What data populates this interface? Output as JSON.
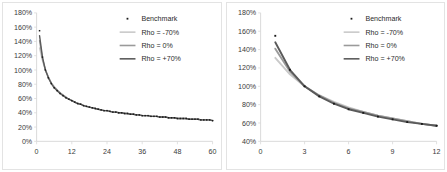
{
  "figure": {
    "panel_count": 2,
    "background": "#ffffff",
    "border_color": "#e3e3e3"
  },
  "legend": {
    "benchmark_label": "Benchmark",
    "rho_neg_label": "Rho = -70%",
    "rho_zero_label": "Rho = 0%",
    "rho_pos_label": "Rho = +70%",
    "marker_color": "#1a1a1a",
    "rho_neg_color": "#c9c9c9",
    "rho_zero_color": "#9a9a9a",
    "rho_pos_color": "#5a5a5a"
  },
  "chart_data": [
    {
      "type": "line",
      "title": "",
      "xlabel": "",
      "ylabel": "",
      "xlim": [
        0,
        60
      ],
      "ylim": [
        0,
        180
      ],
      "xticks": [
        0,
        12,
        24,
        36,
        48,
        60
      ],
      "yticks": [
        0,
        20,
        40,
        60,
        80,
        100,
        120,
        140,
        160,
        180
      ],
      "xtick_labels": [
        "0",
        "12",
        "24",
        "36",
        "48",
        "60"
      ],
      "ytick_labels": [
        "0%",
        "20%",
        "40%",
        "60%",
        "80%",
        "100%",
        "120%",
        "140%",
        "160%",
        "180%"
      ],
      "grid": false,
      "legend_position": "upper right",
      "x": [
        1,
        2,
        3,
        4,
        5,
        6,
        7,
        8,
        9,
        10,
        11,
        12,
        13,
        14,
        15,
        16,
        17,
        18,
        19,
        20,
        21,
        22,
        23,
        24,
        25,
        26,
        27,
        28,
        29,
        30,
        31,
        32,
        33,
        34,
        35,
        36,
        37,
        38,
        39,
        40,
        41,
        42,
        43,
        44,
        45,
        46,
        47,
        48,
        49,
        50,
        51,
        52,
        53,
        54,
        55,
        56,
        57,
        58,
        59,
        60
      ],
      "benchmark_values": [
        155,
        118,
        100,
        89,
        81,
        75,
        71,
        67,
        64,
        61,
        59,
        57,
        55,
        53,
        52,
        50,
        49,
        48,
        47,
        46,
        45,
        44,
        43,
        43,
        42,
        41,
        41,
        40,
        40,
        39,
        39,
        38,
        38,
        37,
        37,
        36,
        36,
        36,
        35,
        35,
        35,
        34,
        34,
        34,
        33,
        33,
        33,
        32,
        32,
        32,
        32,
        31,
        31,
        31,
        31,
        30,
        30,
        30,
        30,
        29
      ],
      "series": [
        {
          "name": "Rho = -70%",
          "color": "#c9c9c9",
          "values": [
            131,
            113,
            100,
            90,
            82,
            77,
            72,
            68,
            65,
            62,
            59,
            57,
            55,
            53,
            52,
            50,
            49,
            48,
            47,
            46,
            45,
            44,
            43,
            43,
            42,
            41,
            41,
            40,
            40,
            39,
            39,
            38,
            38,
            37,
            37,
            36,
            36,
            36,
            35,
            35,
            35,
            34,
            34,
            34,
            33,
            33,
            33,
            32,
            32,
            32,
            32,
            31,
            31,
            31,
            31,
            30,
            30,
            30,
            30,
            29
          ]
        },
        {
          "name": "Rho = 0%",
          "color": "#9a9a9a",
          "values": [
            141,
            116,
            100,
            90,
            82,
            76,
            72,
            68,
            65,
            62,
            59,
            57,
            55,
            53,
            52,
            50,
            49,
            48,
            47,
            46,
            45,
            44,
            43,
            43,
            42,
            41,
            41,
            40,
            40,
            39,
            39,
            38,
            38,
            37,
            37,
            36,
            36,
            36,
            35,
            35,
            35,
            34,
            34,
            34,
            33,
            33,
            33,
            32,
            32,
            32,
            32,
            31,
            31,
            31,
            31,
            30,
            30,
            30,
            30,
            29
          ]
        },
        {
          "name": "Rho = +70%",
          "color": "#5a5a5a",
          "values": [
            148,
            118,
            100,
            89,
            81,
            75,
            71,
            67,
            64,
            61,
            59,
            57,
            55,
            53,
            52,
            50,
            49,
            48,
            47,
            46,
            45,
            44,
            43,
            43,
            42,
            41,
            41,
            40,
            40,
            39,
            39,
            38,
            38,
            37,
            37,
            36,
            36,
            36,
            35,
            35,
            35,
            34,
            34,
            34,
            33,
            33,
            33,
            32,
            32,
            32,
            32,
            31,
            31,
            31,
            31,
            30,
            30,
            30,
            30,
            29
          ]
        }
      ]
    },
    {
      "type": "line",
      "title": "",
      "xlabel": "",
      "ylabel": "",
      "xlim": [
        0,
        12
      ],
      "ylim": [
        40,
        180
      ],
      "xticks": [
        0,
        3,
        6,
        9,
        12
      ],
      "yticks": [
        40,
        60,
        80,
        100,
        120,
        140,
        160,
        180
      ],
      "xtick_labels": [
        "0",
        "3",
        "6",
        "9",
        "12"
      ],
      "ytick_labels": [
        "40%",
        "60%",
        "80%",
        "100%",
        "120%",
        "140%",
        "160%",
        "180%"
      ],
      "grid": false,
      "legend_position": "upper right",
      "x": [
        1,
        2,
        3,
        4,
        5,
        6,
        7,
        8,
        9,
        10,
        11,
        12
      ],
      "benchmark_values": [
        155,
        118,
        100,
        89,
        81,
        75,
        71,
        67,
        64,
        61,
        59,
        57
      ],
      "series": [
        {
          "name": "Rho = -70%",
          "color": "#c9c9c9",
          "values": [
            131,
            113,
            100,
            90,
            83,
            77,
            72,
            68,
            65,
            62,
            59,
            57
          ]
        },
        {
          "name": "Rho = 0%",
          "color": "#9a9a9a",
          "values": [
            141,
            116,
            100,
            90,
            82,
            76,
            72,
            68,
            65,
            62,
            59,
            57
          ]
        },
        {
          "name": "Rho = +70%",
          "color": "#5a5a5a",
          "values": [
            148,
            118,
            100,
            89,
            81,
            75,
            71,
            67,
            64,
            61,
            59,
            57
          ]
        }
      ]
    }
  ]
}
